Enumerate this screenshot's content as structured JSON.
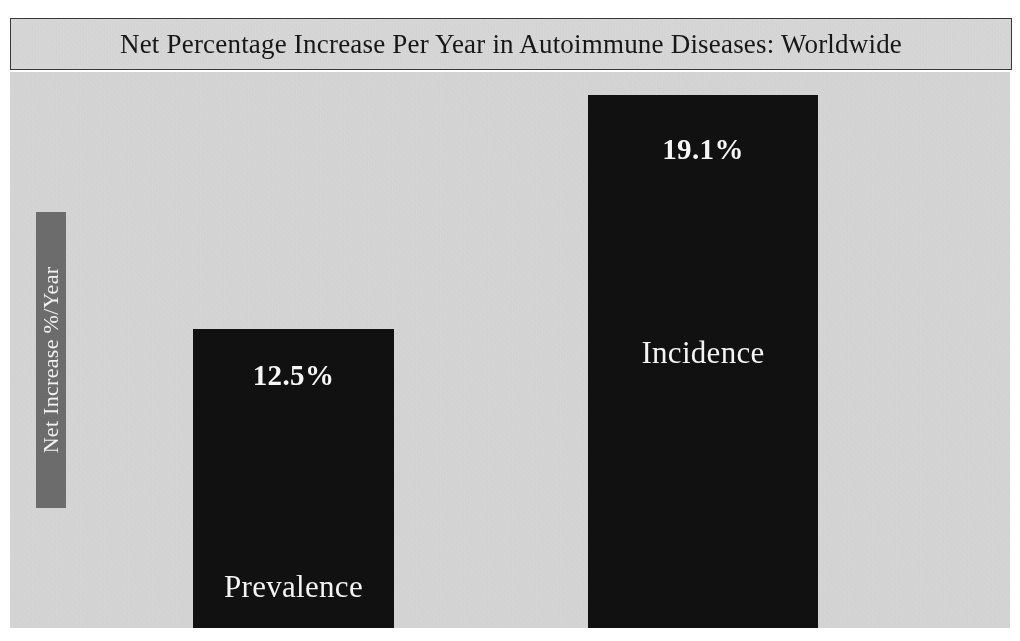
{
  "chart_data": {
    "type": "bar",
    "title": "Net Percentage Increase Per Year in Autoimmune Diseases: Worldwide",
    "xlabel": "",
    "ylabel": "Net Increase %/Year",
    "categories": [
      "Prevalence",
      "Incidence"
    ],
    "values": [
      12.5,
      19.1
    ],
    "value_labels": [
      "12.5%",
      "19.1%"
    ],
    "unit": "%",
    "ylim": [
      0,
      20
    ],
    "grid": false,
    "legend": "none",
    "series": [
      {
        "name": "Net Increase %/Year",
        "values": [
          12.5,
          19.1
        ],
        "color": "#111111"
      }
    ],
    "colors": {
      "bar": "#111111",
      "plot_background": "#d4d4d4",
      "title_background": "#d6d6d6",
      "title_border": "#3a3a3a",
      "axis_label_background": "#6d6d6d",
      "axis_label_text": "#f2f2f2",
      "bar_text": "#f4f4f4",
      "page_background": "#ffffff"
    }
  },
  "title": {
    "text": "Net Percentage Increase Per Year in Autoimmune Diseases: Worldwide"
  },
  "axis": {
    "y_label": "Net Increase %/Year"
  },
  "bars": [
    {
      "category": "Prevalence",
      "value_label": "12.5%",
      "value": 12.5
    },
    {
      "category": "Incidence",
      "value_label": "19.1%",
      "value": 19.1
    }
  ]
}
